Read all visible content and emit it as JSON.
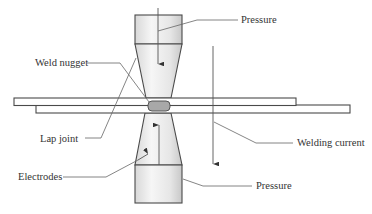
{
  "diagram": {
    "labels": {
      "pressure_top": "Pressure",
      "weld_nugget": "Weld nugget",
      "lap_joint": "Lap joint",
      "welding_current": "Welding current",
      "electrodes": "Electrodes",
      "pressure_bottom": "Pressure"
    },
    "components": [
      "upper-electrode",
      "lower-electrode",
      "upper-sheet",
      "lower-sheet",
      "weld-nugget",
      "pressure-arrow-down",
      "pressure-arrow-up",
      "welding-current-arrow"
    ],
    "colors": {
      "outline": "#4a4a4a",
      "electrode_fill_light": "#f4f4f4",
      "electrode_fill_dark": "#cfcfcf",
      "nugget_fill": "#a8a8a8",
      "leader": "#666666",
      "text": "#333333"
    }
  }
}
